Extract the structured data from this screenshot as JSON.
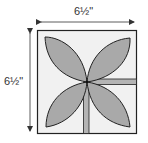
{
  "diagram": {
    "type": "quilt-block",
    "dimensions": {
      "width_label": "6½\"",
      "height_label": "6½\""
    },
    "colors": {
      "background": "#ffffff",
      "block_fill": "#f1f1f1",
      "petal_fill": "#a9a9a9",
      "stem_fill": "#b4b4b4",
      "outline": "#222222",
      "arrow": "#333333"
    },
    "elements": {
      "petals": [
        "top-left",
        "top-right",
        "bottom-left",
        "bottom-right"
      ],
      "stems": [
        "horizontal-right",
        "vertical-down"
      ]
    }
  }
}
